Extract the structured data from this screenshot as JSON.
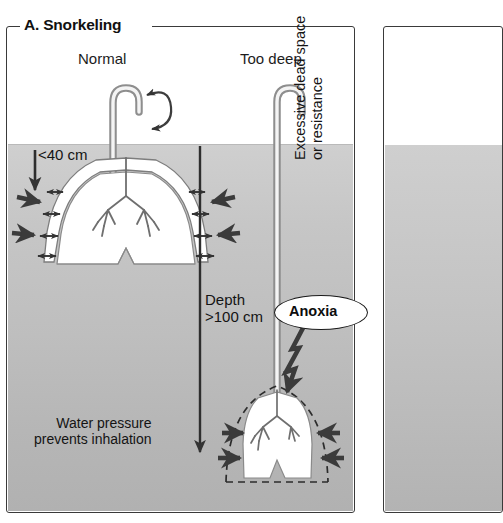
{
  "figure": {
    "panel_label": "A. Snorkeling",
    "columns": [
      {
        "id": "normal",
        "heading": "Normal"
      },
      {
        "id": "too_deep",
        "heading": "Too deep"
      }
    ],
    "annotations": {
      "snorkel_depth_normal": "<40 cm",
      "depth_label": "Depth\n>100 cm",
      "water_pressure": "Water pressure\nprevents inhalation",
      "dead_space": "Excessive dead space\nor resistance",
      "anoxia": "Anoxia"
    },
    "icons": {
      "airflow": "circular-bidirectional-airflow-arrow",
      "depth_arrow": "downward-depth-arrow",
      "pressure_arrow": "inward-pressure-arrow",
      "expansion_arrow": "bidirectional-expansion-arrow",
      "lightning": "lightning-bolt-pointer",
      "collapsed_outline": "dashed-normal-lung-outline"
    },
    "colors": {
      "frame": "#3a3a3a",
      "water_top": "#cfcfcf",
      "water_bottom": "#b1b1b1",
      "lung_fill": "#ffffff",
      "ink": "#141414",
      "arrow": "#4a4a4a"
    }
  }
}
